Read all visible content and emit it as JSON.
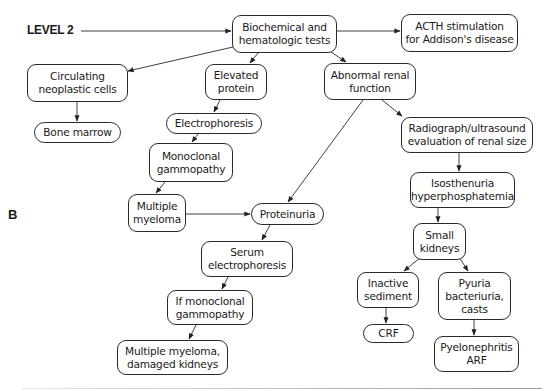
{
  "labels": {
    "level": "LEVEL 2",
    "panel": "B"
  },
  "nodes": {
    "biochemical": "Biochemical and\nhematologic tests",
    "acth": "ACTH stimulation\nfor Addison's disease",
    "circulating": "Circulating\nneoplastic cells",
    "bone_marrow": "Bone marrow",
    "elevated_protein": "Elevated\nprotein",
    "electrophoresis": "Electrophoresis",
    "monoclonal": "Monoclonal\ngammopathy",
    "multiple_myeloma": "Multiple\nmyeloma",
    "abnormal_renal": "Abnormal renal\nfunction",
    "radiograph": "Radiograph/ultrasound\nevaluation of renal size",
    "isosthenuria": "Isosthenuria\nhyperphosphatemia",
    "small_kidneys": "Small\nkidneys",
    "proteinuria": "Proteinuria",
    "serum_electrophoresis": "Serum\nelectrophoresis",
    "if_monoclonal": "If monoclonal\ngammopathy",
    "myeloma_damaged": "Multiple myeloma,\ndamaged kidneys",
    "inactive_sediment": "Inactive\nsediment",
    "crf": "CRF",
    "pyuria": "Pyuria\nbacteriuria,\ncasts",
    "pyelonephritis": "Pyelonephritis\nARF"
  },
  "edges": [
    {
      "from": "level-label",
      "to": "biochemical"
    },
    {
      "from": "biochemical",
      "to": "acth"
    },
    {
      "from": "biochemical",
      "to": "circulating"
    },
    {
      "from": "biochemical",
      "to": "elevated_protein"
    },
    {
      "from": "biochemical",
      "to": "abnormal_renal"
    },
    {
      "from": "circulating",
      "to": "bone_marrow"
    },
    {
      "from": "elevated_protein",
      "to": "electrophoresis"
    },
    {
      "from": "electrophoresis",
      "to": "monoclonal"
    },
    {
      "from": "monoclonal",
      "to": "multiple_myeloma"
    },
    {
      "from": "multiple_myeloma",
      "to": "proteinuria"
    },
    {
      "from": "abnormal_renal",
      "to": "proteinuria"
    },
    {
      "from": "abnormal_renal",
      "to": "radiograph"
    },
    {
      "from": "radiograph",
      "to": "isosthenuria"
    },
    {
      "from": "isosthenuria",
      "to": "small_kidneys"
    },
    {
      "from": "small_kidneys",
      "to": "inactive_sediment"
    },
    {
      "from": "small_kidneys",
      "to": "pyuria"
    },
    {
      "from": "inactive_sediment",
      "to": "crf"
    },
    {
      "from": "pyuria",
      "to": "pyelonephritis"
    },
    {
      "from": "proteinuria",
      "to": "serum_electrophoresis"
    },
    {
      "from": "serum_electrophoresis",
      "to": "if_monoclonal"
    },
    {
      "from": "if_monoclonal",
      "to": "myeloma_damaged"
    }
  ],
  "colors": {
    "stroke": "#2a2a2a",
    "text": "#1a1a1a",
    "background": "#ffffff"
  }
}
